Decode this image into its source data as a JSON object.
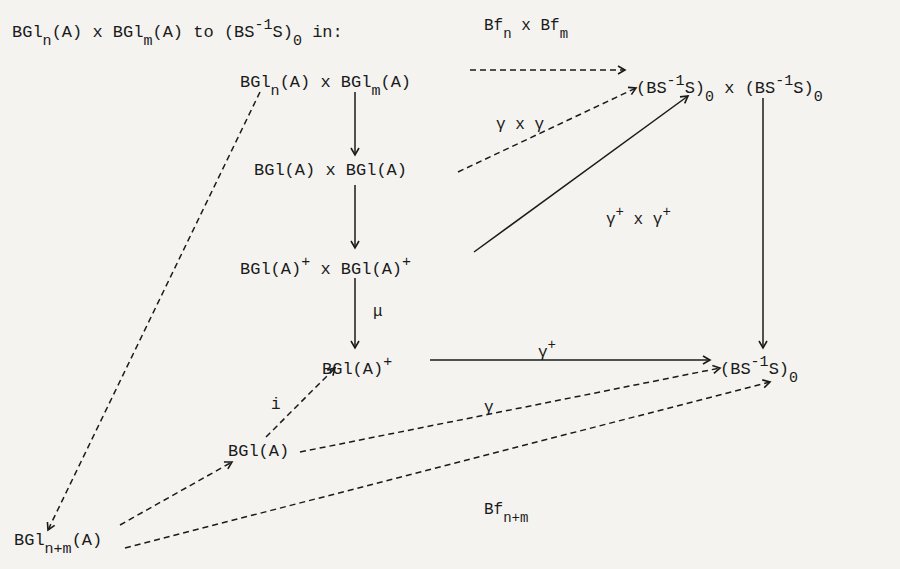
{
  "caption": {
    "part1": "BGl",
    "sub1": "n",
    "part2": "(A) x BGl",
    "sub2": "m",
    "part3": "(A)  to  (BS",
    "sup1": "-1",
    "part4": "S)",
    "sub3": "0",
    "part5": " in:"
  },
  "nodes": {
    "top_left": {
      "a": "BGl",
      "s1": "n",
      "b": "(A)  x BGl",
      "s2": "m",
      "c": "(A)"
    },
    "top_right": {
      "a": "(BS",
      "p1": "-1",
      "b": "S)",
      "s1": "0",
      "c": " x  (BS",
      "p2": "-1",
      "d": "S)",
      "s2": "0"
    },
    "row2": {
      "text": "BGl(A)  x BGl(A)"
    },
    "row3": {
      "a": "BGl(A)",
      "p1": "+",
      "b": " x BGl(A)",
      "p2": "+"
    },
    "row4": {
      "a": "BGl(A)",
      "p1": "+"
    },
    "right_mid": {
      "a": "(BS",
      "p1": "-1",
      "b": "S)",
      "s1": "0"
    },
    "row5": {
      "text": "BGl(A)"
    },
    "bottom": {
      "a": "BGl",
      "s1": "n+m",
      "b": "(A)"
    }
  },
  "labels": {
    "bf_top": {
      "a": "Bf",
      "s1": "n",
      "b": " x Bf",
      "s2": "m"
    },
    "gamma_x_gamma": "γ x γ",
    "gamma_plus_x": {
      "a": "γ",
      "p1": "+",
      "b": " x γ",
      "p2": "+"
    },
    "mu": "μ",
    "gamma_plus": {
      "a": "γ",
      "p1": "+"
    },
    "i": "i",
    "gamma": "γ",
    "bf_nm": {
      "a": "Bf",
      "s1": "n+m"
    }
  }
}
